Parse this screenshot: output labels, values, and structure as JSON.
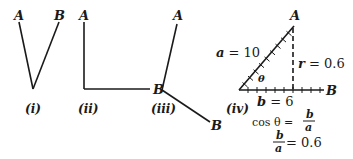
{
  "figures": [
    {
      "id": "i",
      "caption": "(i)",
      "point_a": "A",
      "point_b": "B"
    },
    {
      "id": "ii",
      "caption": "(ii)",
      "point_a": "A",
      "point_b": "B"
    },
    {
      "id": "iii",
      "caption": "(iii)",
      "point_a": "A",
      "point_b": "B"
    },
    {
      "id": "iv",
      "caption": "(iv)",
      "point_a": "A",
      "point_b": "B",
      "angle": "θ",
      "hypotenuse_label": "a = 10",
      "vertical_label": "r = 0.6",
      "base_label": "b = 6",
      "formula_1_lhs": "cos θ =",
      "formula_1_num": "b",
      "formula_1_den": "a",
      "formula_2_num": "b",
      "formula_2_den": "a",
      "formula_2_rhs": "= 0.6"
    }
  ],
  "colors": {
    "ink": "#1a1a1a",
    "background": "#ffffff"
  }
}
